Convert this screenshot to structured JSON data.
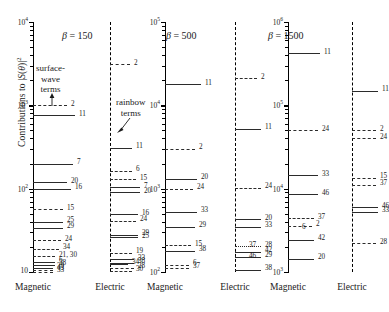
{
  "axis": {
    "ylabel_prefix": "Contributions to |",
    "ylabel_math": "S(θ)",
    "ylabel_suffix": "|",
    "ylabel_exp": "2",
    "ylabel_full": "Contributions to |S(θ)|²"
  },
  "annotations": {
    "surface_wave": "surface-\nwave\nterms",
    "surface_wave_l1": "surface-",
    "surface_wave_l2": "wave",
    "surface_wave_l3": "terms",
    "rainbow_l1": "rainbow",
    "rainbow_l2": "terms"
  },
  "column_names": {
    "magnetic": "Magnetic",
    "electric": "Electric"
  },
  "beta_labels": [
    {
      "symbol": "β",
      "eq": "=",
      "value": "150"
    },
    {
      "symbol": "β",
      "eq": "=",
      "value": "500"
    },
    {
      "symbol": "β",
      "eq": "=",
      "value": "1500"
    }
  ],
  "chart_data": {
    "type": "table",
    "title": "",
    "subtitle": "",
    "xlabel": "",
    "ylabel": "Contributions to |S(θ)|²",
    "grid": false,
    "legend": "none",
    "panels": [
      {
        "name": "magnetic-150",
        "beta": 150,
        "polarization": "Magnetic",
        "axis_type": "solid",
        "ylim": [
          10,
          10000
        ],
        "ticks": [
          {
            "label": "10",
            "exp": "4",
            "value": 10000
          },
          {
            "label": "10",
            "exp": "3",
            "value": 1000
          },
          {
            "label": "10",
            "exp": "2",
            "value": 100
          },
          {
            "label": "10",
            "exp": "",
            "value": 10
          }
        ],
        "levels": [
          {
            "mode": "2",
            "value": 1000,
            "style": "dash",
            "len": 34
          },
          {
            "mode": "11",
            "value": 760,
            "style": "solid2",
            "len": 42
          },
          {
            "mode": "7",
            "value": 200,
            "style": "solid",
            "len": 40
          },
          {
            "mode": "20",
            "value": 120,
            "style": "solid",
            "len": 34
          },
          {
            "mode": "16",
            "value": 100,
            "style": "solid2",
            "len": 38
          },
          {
            "mode": "15",
            "value": 57,
            "style": "dash",
            "len": 30
          },
          {
            "mode": "25",
            "value": 40,
            "style": "solid2",
            "len": 30
          },
          {
            "mode": "29",
            "value": 34,
            "style": "solid",
            "len": 30
          },
          {
            "mode": "24",
            "value": 24,
            "style": "dash",
            "len": 28
          },
          {
            "mode": "34",
            "value": 19,
            "style": "dash",
            "len": 26
          },
          {
            "mode": "21, 30",
            "value": 15.5,
            "style": "dash",
            "len": 22
          },
          {
            "mode": "6",
            "value": 13.2,
            "style": "solid2",
            "len": 22
          },
          {
            "mode": "38",
            "value": 12.2,
            "style": "solid",
            "len": 22
          },
          {
            "mode": "39",
            "value": 11.3,
            "style": "solid2",
            "len": 20
          },
          {
            "mode": "43",
            "value": 10.7,
            "style": "dash",
            "len": 20
          },
          {
            "mode": "33",
            "value": 10.1,
            "style": "dash",
            "len": 20
          }
        ]
      },
      {
        "name": "electric-150",
        "beta": 150,
        "polarization": "Electric",
        "axis_type": "dashed",
        "ylim": [
          10,
          10000
        ],
        "ticks": [],
        "levels": [
          {
            "mode": "2",
            "value": 3100,
            "style": "dash",
            "len": 20
          },
          {
            "mode": "11",
            "value": 310,
            "style": "solid",
            "len": 22
          },
          {
            "mode": "6",
            "value": 165,
            "style": "dash",
            "len": 22
          },
          {
            "mode": "15",
            "value": 130,
            "style": "dash",
            "len": 26
          },
          {
            "mode": "7",
            "value": 104,
            "style": "solid",
            "len": 30
          },
          {
            "mode": "20",
            "value": 90,
            "style": "solid",
            "len": 30
          },
          {
            "mode": "16",
            "value": 49,
            "style": "solid2",
            "len": 28
          },
          {
            "mode": "24",
            "value": 41,
            "style": "dash",
            "len": 26
          },
          {
            "mode": "29",
            "value": 28,
            "style": "solid2",
            "len": 28
          },
          {
            "mode": "25",
            "value": 26,
            "style": "solid2",
            "len": 28
          },
          {
            "mode": "19",
            "value": 17,
            "style": "dash",
            "len": 22
          },
          {
            "mode": "33",
            "value": 14.2,
            "style": "solid2",
            "len": 24
          },
          {
            "mode": "38",
            "value": 13,
            "style": "solid2",
            "len": 24
          },
          {
            "mode": "34",
            "value": 12.6,
            "style": "solid",
            "len": 18
          },
          {
            "mode": "28",
            "value": 11.2,
            "style": "dash",
            "len": 24
          },
          {
            "mode": "30",
            "value": 10.3,
            "style": "dash",
            "len": 22
          }
        ]
      },
      {
        "name": "magnetic-500",
        "beta": 500,
        "polarization": "Magnetic",
        "axis_type": "solid",
        "ylim": [
          100,
          100000
        ],
        "ticks": [
          {
            "label": "10",
            "exp": "5",
            "value": 100000
          },
          {
            "label": "10",
            "exp": "4",
            "value": 10000
          },
          {
            "label": "10",
            "exp": "3",
            "value": 1000
          },
          {
            "label": "10",
            "exp": "2",
            "value": 100
          }
        ],
        "levels": [
          {
            "mode": "11",
            "value": 18000,
            "style": "solid",
            "len": 36
          },
          {
            "mode": "2",
            "value": 3000,
            "style": "dash",
            "len": 30
          },
          {
            "mode": "20",
            "value": 1320,
            "style": "solid",
            "len": 32
          },
          {
            "mode": "24",
            "value": 1000,
            "style": "dash",
            "len": 28
          },
          {
            "mode": "33",
            "value": 530,
            "style": "solid",
            "len": 32
          },
          {
            "mode": "29",
            "value": 350,
            "style": "solid",
            "len": 30
          },
          {
            "mode": "15",
            "value": 210,
            "style": "dash",
            "len": 26
          },
          {
            "mode": "38",
            "value": 180,
            "style": "solid2",
            "len": 30
          },
          {
            "mode": "6",
            "value": 122,
            "style": "dash",
            "len": 24
          },
          {
            "mode": "37",
            "value": 112,
            "style": "dash",
            "len": 24
          }
        ]
      },
      {
        "name": "electric-500",
        "beta": 500,
        "polarization": "Electric",
        "axis_type": "dashed",
        "ylim": [
          100,
          100000
        ],
        "ticks": [],
        "levels": [
          {
            "mode": "2",
            "value": 21000,
            "style": "dash",
            "len": 22
          },
          {
            "mode": "11",
            "value": 5200,
            "style": "solid",
            "len": 26
          },
          {
            "mode": "24",
            "value": 1020,
            "style": "dash",
            "len": 26
          },
          {
            "mode": "20",
            "value": 430,
            "style": "solid2",
            "len": 26
          },
          {
            "mode": "33",
            "value": 350,
            "style": "solid",
            "len": 26
          },
          {
            "mode": "28",
            "value": 205,
            "style": "dot",
            "len": 26
          },
          {
            "mode": "37",
            "value": 200,
            "style": "none",
            "len": 0
          },
          {
            "mode": "42",
            "value": 175,
            "style": "solid",
            "len": 26
          },
          {
            "mode": "29",
            "value": 152,
            "style": "solid2",
            "len": 26
          },
          {
            "mode": "46",
            "value": 150,
            "style": "none",
            "len": 0
          },
          {
            "mode": "38",
            "value": 107,
            "style": "solid",
            "len": 26
          }
        ]
      },
      {
        "name": "magnetic-1500",
        "beta": 1500,
        "polarization": "Magnetic",
        "axis_type": "solid",
        "ylim": [
          1000,
          1000000
        ],
        "ticks": [
          {
            "label": "10",
            "exp": "6",
            "value": 1000000
          },
          {
            "label": "10",
            "exp": "5",
            "value": 100000
          },
          {
            "label": "10",
            "exp": "4",
            "value": 10000
          },
          {
            "label": "10",
            "exp": "3",
            "value": 1000
          }
        ],
        "levels": [
          {
            "mode": "11",
            "value": 420000,
            "style": "solid",
            "len": 32
          },
          {
            "mode": "24",
            "value": 50000,
            "style": "dash",
            "len": 30
          },
          {
            "mode": "33",
            "value": 14500,
            "style": "solid",
            "len": 30
          },
          {
            "mode": "46",
            "value": 8600,
            "style": "solid",
            "len": 30
          },
          {
            "mode": "37",
            "value": 4400,
            "style": "dash",
            "len": 26
          },
          {
            "mode": "2",
            "value": 3600,
            "style": "dash",
            "len": 24
          },
          {
            "mode": "6",
            "value": 3350,
            "style": "none",
            "len": 0
          },
          {
            "mode": "42",
            "value": 2450,
            "style": "solid",
            "len": 26
          },
          {
            "mode": "20",
            "value": 1450,
            "style": "solid",
            "len": 26
          }
        ]
      },
      {
        "name": "electric-1500",
        "beta": 1500,
        "polarization": "Electric",
        "axis_type": "dashed",
        "ylim": [
          1000,
          1000000
        ],
        "ticks": [],
        "levels": [
          {
            "mode": "11",
            "value": 150000,
            "style": "solid",
            "len": 26
          },
          {
            "mode": "2",
            "value": 50000,
            "style": "dash",
            "len": 24
          },
          {
            "mode": "24",
            "value": 40000,
            "style": "dash",
            "len": 24
          },
          {
            "mode": "15",
            "value": 13500,
            "style": "dash",
            "len": 24
          },
          {
            "mode": "37",
            "value": 11200,
            "style": "dash",
            "len": 24
          },
          {
            "mode": "46",
            "value": 6000,
            "style": "solid",
            "len": 26
          },
          {
            "mode": "33",
            "value": 5300,
            "style": "solid",
            "len": 26
          },
          {
            "mode": "28",
            "value": 2200,
            "style": "dash",
            "len": 24
          }
        ]
      }
    ]
  }
}
